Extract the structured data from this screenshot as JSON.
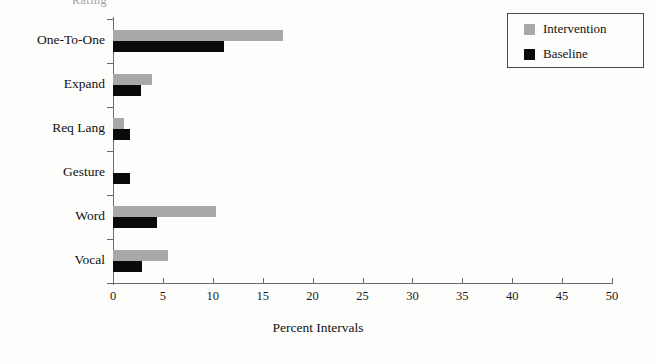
{
  "title_fragment": "Rating",
  "legend": {
    "position": "top-right",
    "entries": [
      {
        "label": "Intervention",
        "color": "#a8a8a8"
      },
      {
        "label": "Baseline",
        "color": "#0a0a0a"
      }
    ]
  },
  "chart_data": {
    "type": "bar",
    "orientation": "horizontal",
    "title": "",
    "xlabel": "Percent Intervals",
    "ylabel": "",
    "categories": [
      "One-To-One",
      "Expand",
      "Req Lang",
      "Gesture",
      "Word",
      "Vocal"
    ],
    "series": [
      {
        "name": "Intervention",
        "color": "#a8a8a8",
        "values": [
          17.0,
          3.9,
          1.1,
          0.0,
          10.3,
          5.5
        ]
      },
      {
        "name": "Baseline",
        "color": "#0a0a0a",
        "values": [
          11.1,
          2.8,
          1.7,
          1.7,
          4.4,
          2.9
        ]
      }
    ],
    "xlim": [
      0,
      50
    ],
    "xticks": [
      0,
      5,
      10,
      15,
      20,
      25,
      30,
      35,
      40,
      45,
      50
    ],
    "xticklabels": [
      "0",
      "5",
      "10",
      "15",
      "20",
      "25",
      "30",
      "35",
      "40",
      "45",
      "50"
    ],
    "grid": false,
    "legend_position": "top-right"
  }
}
